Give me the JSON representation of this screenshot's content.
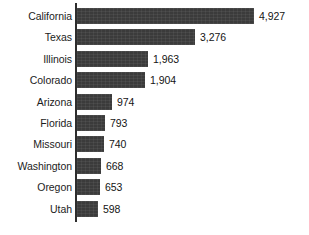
{
  "chart_data": {
    "type": "bar",
    "orientation": "horizontal",
    "title": "",
    "subtitle": "",
    "xlabel": "",
    "ylabel": "",
    "grid": false,
    "legend": null,
    "axis": {
      "value_axis_min": 0,
      "value_axis_max": 4927,
      "ticks_shown": false
    },
    "categories": [
      "California",
      "Texas",
      "Illinois",
      "Colorado",
      "Arizona",
      "Florida",
      "Missouri",
      "Washington",
      "Oregon",
      "Utah"
    ],
    "values": [
      4927,
      3276,
      1963,
      1904,
      974,
      793,
      740,
      668,
      653,
      598
    ],
    "value_labels": [
      "4,927",
      "3,276",
      "1,963",
      "1,904",
      "974",
      "793",
      "740",
      "668",
      "653",
      "598"
    ],
    "colors": {
      "bar": "#3b3b3b",
      "axis": "#2e2e2e",
      "text": "#1c1c1c",
      "background": "#ffffff"
    }
  },
  "rows": [
    {
      "label": "California",
      "value": 4927,
      "value_label": "4,927"
    },
    {
      "label": "Texas",
      "value": 3276,
      "value_label": "3,276"
    },
    {
      "label": "Illinois",
      "value": 1963,
      "value_label": "1,963"
    },
    {
      "label": "Colorado",
      "value": 1904,
      "value_label": "1,904"
    },
    {
      "label": "Arizona",
      "value": 974,
      "value_label": "974"
    },
    {
      "label": "Florida",
      "value": 793,
      "value_label": "793"
    },
    {
      "label": "Missouri",
      "value": 740,
      "value_label": "740"
    },
    {
      "label": "Washington",
      "value": 668,
      "value_label": "668"
    },
    {
      "label": "Oregon",
      "value": 653,
      "value_label": "653"
    },
    {
      "label": "Utah",
      "value": 598,
      "value_label": "598"
    }
  ]
}
